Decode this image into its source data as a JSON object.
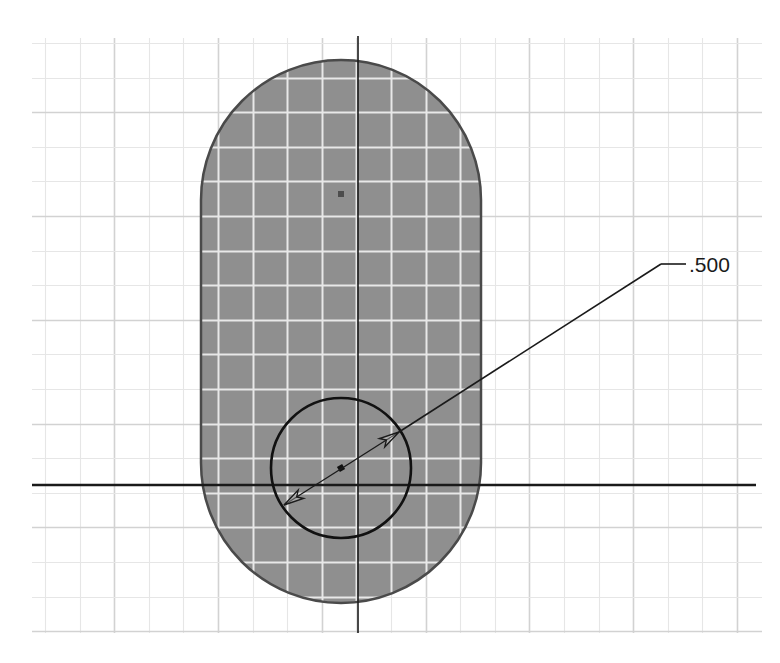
{
  "sketch": {
    "background_color": "#ffffff",
    "grid": {
      "x_start": 32,
      "x_end": 762,
      "y_start": 38,
      "y_end": 633,
      "spacing": 34.6,
      "first_x": 45,
      "first_y": 43,
      "minor_color": "#e6e6e6",
      "major_color": "#d2d2d2",
      "major_every": 3,
      "inner_color": "#e8e8e8"
    },
    "axes": {
      "vertical": {
        "x": 358,
        "y1": 36,
        "y2": 633,
        "color": "#1a1a1a"
      },
      "horizontal": {
        "y": 485,
        "x1": 32,
        "x2": 756,
        "color": "#1a1a1a"
      }
    },
    "slot": {
      "left": 201,
      "right": 481,
      "top_arc_center_y": 200,
      "bottom_arc_center_y": 463,
      "radius": 140,
      "fill_color": "#8f8f8f",
      "stroke_color": "#4a4a4a"
    },
    "center_point": {
      "x": 341,
      "y": 194,
      "color": "#4d4d4d"
    },
    "circle": {
      "cx": 341,
      "cy": 468,
      "r": 70,
      "stroke_color": "#111111",
      "center_mark_color": "#111111"
    },
    "dimension": {
      "label": ".500",
      "type": "diameter",
      "line_start": {
        "x": 284,
        "y": 505
      },
      "line_end": {
        "x": 399,
        "y": 432
      },
      "elbow": {
        "x": 661,
        "y": 264
      },
      "leader_end": {
        "x": 686,
        "y": 264
      },
      "text_x": 689,
      "text_y": 272,
      "color": "#1a1a1a"
    }
  }
}
